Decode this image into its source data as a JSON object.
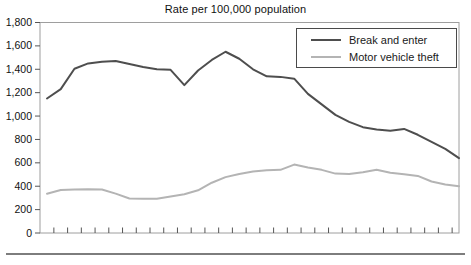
{
  "title": "Rate per 100,000 population",
  "legend": {
    "items": [
      {
        "label": "Break and enter",
        "color": "#4e4e4e"
      },
      {
        "label": "Motor vehicle theft",
        "color": "#b4b4b4"
      }
    ]
  },
  "chart_data": {
    "type": "line",
    "title": "Rate per 100,000 population",
    "ylim": [
      0,
      1800
    ],
    "y_ticks": [
      0,
      200,
      400,
      600,
      800,
      1000,
      1200,
      1400,
      1600,
      1800
    ],
    "y_tick_labels": [
      "0",
      "200",
      "400",
      "600",
      "800",
      "1,000",
      "1,200",
      "1,400",
      "1,600",
      "1,800"
    ],
    "x_tick_count": 30,
    "x_tick_labels": [],
    "grid": false,
    "legend_position": "top-right",
    "series": [
      {
        "name": "Break and enter",
        "color": "#4e4e4e",
        "values": [
          1150,
          1230,
          1405,
          1450,
          1465,
          1470,
          1445,
          1420,
          1400,
          1395,
          1265,
          1390,
          1480,
          1550,
          1490,
          1400,
          1340,
          1335,
          1320,
          1190,
          1100,
          1010,
          950,
          905,
          885,
          875,
          890,
          840,
          780,
          720,
          640
        ]
      },
      {
        "name": "Motor vehicle theft",
        "color": "#b4b4b4",
        "values": [
          335,
          368,
          372,
          375,
          372,
          337,
          295,
          292,
          292,
          312,
          332,
          365,
          430,
          478,
          505,
          525,
          537,
          540,
          585,
          560,
          540,
          508,
          505,
          520,
          540,
          515,
          503,
          488,
          440,
          415,
          400
        ]
      }
    ]
  },
  "colors": {
    "plot_border": "#9e9e9e",
    "tick": "#555555",
    "axis_text": "#111111",
    "divider": "#7d7d7d",
    "background": "#ffffff"
  }
}
